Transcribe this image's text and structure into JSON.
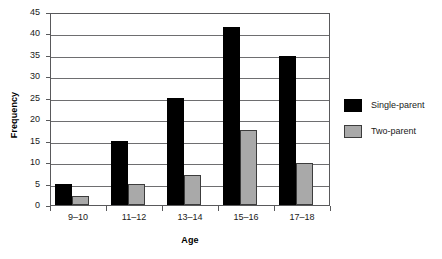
{
  "chart_data": {
    "type": "bar",
    "title": "",
    "subtitle": "",
    "xlabel": "Age",
    "ylabel": "Frequency",
    "categories": [
      "9–10",
      "11–12",
      "13–14",
      "15–16",
      "17–18"
    ],
    "series": [
      {
        "name": "Single-parent",
        "color": "#000000",
        "values": [
          5,
          15,
          25,
          41.5,
          34.8
        ]
      },
      {
        "name": "Two-parent",
        "color": "#a9a9a9",
        "values": [
          2,
          5,
          7,
          17.5,
          9.8
        ]
      }
    ],
    "ylim": [
      0,
      45
    ],
    "ytick_values": [
      0,
      5,
      10,
      15,
      20,
      25,
      30,
      35,
      40,
      45
    ],
    "ytick_labels": [
      "0",
      "5",
      "10",
      "15",
      "20",
      "25",
      "30",
      "35",
      "40",
      "45"
    ],
    "grid": "horizontal",
    "legend_position": "right",
    "background_color": "#ffffff",
    "axis_color": "#59595b"
  },
  "legend": {
    "entries": [
      {
        "label": "Single-parent"
      },
      {
        "label": "Two-parent"
      }
    ]
  }
}
